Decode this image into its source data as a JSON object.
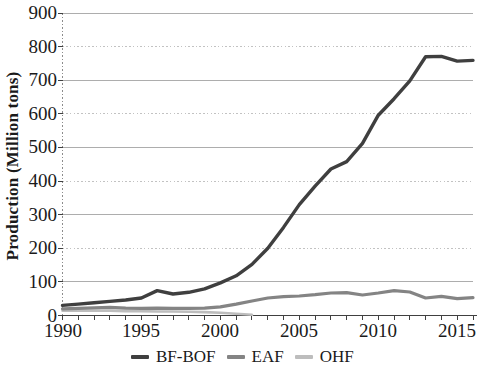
{
  "chart_data": {
    "type": "line",
    "title": "",
    "xlabel": "",
    "ylabel": "Production (Million tons)",
    "ylim": [
      0,
      900
    ],
    "xlim": [
      1990,
      2016
    ],
    "y_ticks": [
      0,
      100,
      200,
      300,
      400,
      500,
      600,
      700,
      800,
      900
    ],
    "x_tick_labels": [
      1990,
      1995,
      2000,
      2005,
      2010,
      2015
    ],
    "grid": "horizontal; solid lines at odd hundreds, dotted at even hundreds",
    "legend_position": "bottom",
    "x": [
      1990,
      1991,
      1992,
      1993,
      1994,
      1995,
      1996,
      1997,
      1998,
      1999,
      2000,
      2001,
      2002,
      2003,
      2004,
      2005,
      2006,
      2007,
      2008,
      2009,
      2010,
      2011,
      2012,
      2013,
      2014,
      2015,
      2016
    ],
    "series": [
      {
        "name": "BF-BOF",
        "color": "#3f3f3f",
        "values": [
          30,
          34,
          38,
          42,
          46,
          52,
          74,
          64,
          69,
          79,
          97,
          118,
          152,
          200,
          262,
          330,
          385,
          436,
          458,
          512,
          596,
          645,
          698,
          770,
          771,
          757,
          759
        ]
      },
      {
        "name": "EAF",
        "color": "#848484",
        "values": [
          20,
          21,
          23,
          24,
          22,
          21,
          22,
          21,
          21,
          22,
          26,
          34,
          43,
          52,
          56,
          58,
          62,
          67,
          68,
          61,
          67,
          74,
          70,
          52,
          57,
          50,
          53
        ]
      },
      {
        "name": "OHF",
        "color": "#bdbdbd",
        "values": [
          14,
          14,
          14,
          14,
          13,
          13,
          12,
          12,
          11,
          10,
          8,
          5,
          2,
          null,
          null,
          null,
          null,
          null,
          null,
          null,
          null,
          null,
          null,
          null,
          null,
          null,
          null
        ]
      }
    ]
  },
  "colors": {
    "background": "#ffffff",
    "axis": "#404040",
    "grid_solid": "#adadad",
    "grid_dotted": "#c2c2c2",
    "text": "#1a1a1a"
  }
}
